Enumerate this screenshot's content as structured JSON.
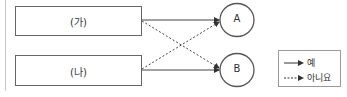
{
  "diagram": {
    "boxes": [
      {
        "id": "ga",
        "label": "(가)"
      },
      {
        "id": "na",
        "label": "(나)"
      }
    ],
    "nodes": [
      {
        "id": "A",
        "label": "A"
      },
      {
        "id": "B",
        "label": "B"
      }
    ],
    "edges": [
      {
        "from": "(가)",
        "to": "A",
        "style": "solid"
      },
      {
        "from": "(가)",
        "to": "B",
        "style": "dashed"
      },
      {
        "from": "(나)",
        "to": "A",
        "style": "dashed"
      },
      {
        "from": "(나)",
        "to": "B",
        "style": "solid"
      }
    ],
    "legend": {
      "yes_label": "예",
      "no_label": "아니요"
    },
    "colors": {
      "stroke": "#555555",
      "box_border": "#666666"
    }
  }
}
